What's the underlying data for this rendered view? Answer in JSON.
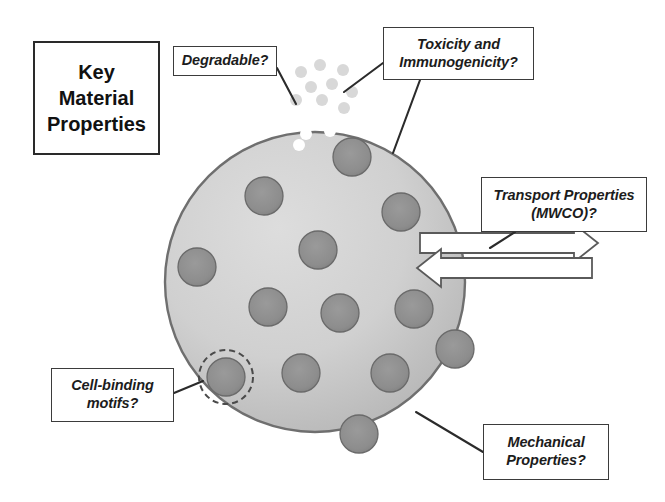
{
  "figure": {
    "width": 665,
    "height": 502,
    "background": "#ffffff"
  },
  "title_box": {
    "name": "key-material-properties",
    "lines": [
      "Key",
      "Material",
      "Properties"
    ],
    "line1": "Key",
    "line2": "Material",
    "line3": "Properties",
    "border_color": "#2a2a2a"
  },
  "callouts": {
    "degradable": {
      "line1": "Degradable?",
      "line2": ""
    },
    "toxicity": {
      "line1": "Toxicity and",
      "line2": "Immunogenicity?"
    },
    "transport": {
      "line1": "Transport Properties",
      "line2": "(MWCO)?"
    },
    "cell_binding": {
      "line1": "Cell-binding",
      "line2": "motifs?"
    },
    "mechanical": {
      "line1": "Mechanical",
      "line2": "Properties?"
    }
  },
  "colors": {
    "hydrogel_fill_light": "#d2d2d2",
    "hydrogel_fill_dark": "#b8b8b8",
    "hydrogel_edge": "#6f6f6f",
    "particle_fill": "#8f8f8f",
    "particle_edge": "#6a6a6a",
    "degraded_fragment": "#d8d8d8",
    "pore_white": "#ffffff",
    "leader_line": "#2b2b2b",
    "arrow_fill": "#ffffff",
    "arrow_edge": "#555555",
    "box_border": "#3b3b3b",
    "text": "#1c1c1c"
  },
  "hydrogel_sphere": {
    "name": "hydrogel-sphere",
    "cx": 315,
    "cy": 282,
    "r": 150
  },
  "particles": [
    {
      "cx": 352,
      "cy": 157,
      "r": 19
    },
    {
      "cx": 264,
      "cy": 196,
      "r": 19
    },
    {
      "cx": 401,
      "cy": 212,
      "r": 19
    },
    {
      "cx": 318,
      "cy": 250,
      "r": 19
    },
    {
      "cx": 197,
      "cy": 267,
      "r": 19
    },
    {
      "cx": 268,
      "cy": 307,
      "r": 19
    },
    {
      "cx": 340,
      "cy": 313,
      "r": 19
    },
    {
      "cx": 414,
      "cy": 309,
      "r": 19
    },
    {
      "cx": 455,
      "cy": 349,
      "r": 19
    },
    {
      "cx": 226,
      "cy": 377,
      "r": 19
    },
    {
      "cx": 301,
      "cy": 373,
      "r": 19
    },
    {
      "cx": 390,
      "cy": 373,
      "r": 19
    },
    {
      "cx": 359,
      "cy": 434,
      "r": 19
    }
  ],
  "highlighted_particle": {
    "name": "cell-binding-motif-highlight",
    "cx": 226,
    "cy": 377,
    "r": 27,
    "dash": "6 4"
  },
  "degraded_fragments": [
    {
      "cx": 301,
      "cy": 72,
      "r": 6
    },
    {
      "cx": 320,
      "cy": 65,
      "r": 6
    },
    {
      "cx": 343,
      "cy": 70,
      "r": 6
    },
    {
      "cx": 311,
      "cy": 87,
      "r": 6
    },
    {
      "cx": 332,
      "cy": 84,
      "r": 6
    },
    {
      "cx": 352,
      "cy": 92,
      "r": 6
    },
    {
      "cx": 296,
      "cy": 100,
      "r": 6
    },
    {
      "cx": 322,
      "cy": 100,
      "r": 6
    },
    {
      "cx": 344,
      "cy": 108,
      "r": 6
    }
  ],
  "pores": [
    {
      "cx": 296,
      "cy": 122,
      "r": 6
    },
    {
      "cx": 318,
      "cy": 117,
      "r": 6
    },
    {
      "cx": 340,
      "cy": 113,
      "r": 6
    },
    {
      "cx": 357,
      "cy": 120,
      "r": 6
    },
    {
      "cx": 306,
      "cy": 134,
      "r": 6
    },
    {
      "cx": 330,
      "cy": 131,
      "r": 6
    },
    {
      "cx": 299,
      "cy": 145,
      "r": 6
    }
  ],
  "transport_arrows": [
    {
      "name": "transport-arrow-outward",
      "direction": "right",
      "y": 243,
      "x1": 420,
      "x2": 598,
      "height": 20
    },
    {
      "name": "transport-arrow-inward",
      "direction": "left",
      "y": 268,
      "x1": 417,
      "x2": 592,
      "height": 20
    }
  ],
  "leader_lines": [
    {
      "name": "leader-degradable",
      "points": "277,68 296,104"
    },
    {
      "name": "leader-toxicity-a",
      "points": "383,63 344,92"
    },
    {
      "name": "leader-toxicity-b",
      "points": "420,80 393,153"
    },
    {
      "name": "leader-transport",
      "points": "515,232 490,248"
    },
    {
      "name": "leader-cellbinding",
      "points": "174,393 203,381"
    },
    {
      "name": "leader-mechanical",
      "points": "483,452 416,412"
    }
  ]
}
